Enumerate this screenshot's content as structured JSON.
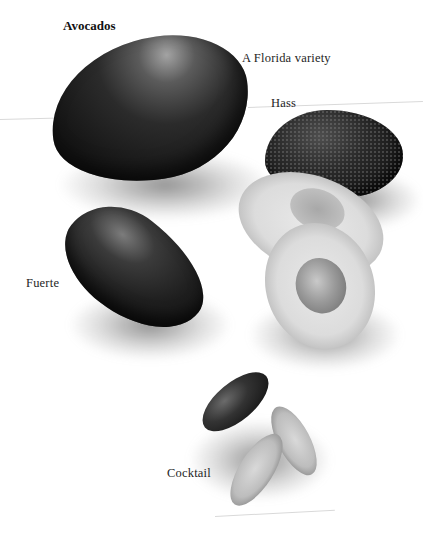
{
  "page": {
    "title": "Avocados",
    "labels": [
      {
        "id": "florida",
        "text": "A Florida variety"
      },
      {
        "id": "hass",
        "text": "Hass"
      },
      {
        "id": "fuerte",
        "text": "Fuerte"
      },
      {
        "id": "cocktail",
        "text": "Cocktail"
      }
    ]
  },
  "figures": [
    {
      "name": "Florida avocado",
      "state": "whole"
    },
    {
      "name": "Hass avocado",
      "state": "whole and halved"
    },
    {
      "name": "Fuerte avocado",
      "state": "whole"
    },
    {
      "name": "Cocktail avocado",
      "state": "whole and halved"
    }
  ],
  "colors": {
    "background": "#ffffff",
    "skin": "#141414",
    "flesh": "#dcdcdc",
    "text": "#1e1e1e"
  }
}
